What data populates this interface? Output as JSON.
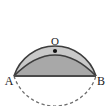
{
  "figure": {
    "background_color": "#ffffff",
    "stroke_color": "#3d3d3d",
    "chord_stroke_color": "#4a4a4a",
    "label_color": "#1a1a1a",
    "upper_fill_color": "#c9c9c9",
    "lens_fill_color": "#a8a8a8",
    "dashed_arc_color": "#6e6e6e"
  },
  "geometry": {
    "circle": {
      "center_x": 55,
      "center_y": 51,
      "radius": 43,
      "upper_arc_style": "solid",
      "lower_arc_style": "dashed"
    },
    "chord": {
      "from": "A",
      "to": "B",
      "x1": 14,
      "y1": 76,
      "x2": 96,
      "y2": 76,
      "style": "solid"
    },
    "inner_arc": {
      "from": "A",
      "to": "B",
      "bulge_direction": "up",
      "apex_x": 55,
      "apex_y": 55,
      "style": "solid"
    },
    "center_dot": {
      "x": 55,
      "y": 51,
      "radius": 2.1
    }
  },
  "labels": {
    "center": {
      "text": "O",
      "x": 55,
      "y": 45,
      "font_size": 11,
      "anchor": "middle"
    },
    "left_vertex": {
      "text": "A",
      "x": 9,
      "y": 85,
      "font_size": 12,
      "anchor": "middle"
    },
    "right_vertex": {
      "text": "B",
      "x": 101,
      "y": 85,
      "font_size": 12,
      "anchor": "middle"
    }
  }
}
